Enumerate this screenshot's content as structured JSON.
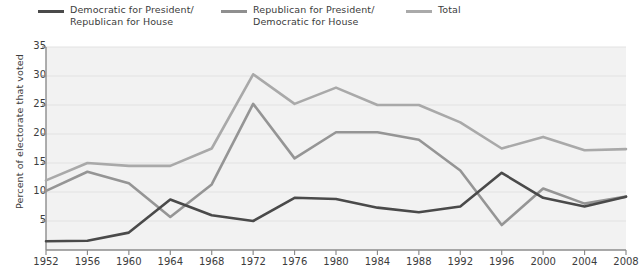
{
  "chart_data": {
    "type": "line",
    "title": "",
    "xlabel": "",
    "ylabel": "Percent of electorate that voted",
    "categories": [
      1952,
      1956,
      1960,
      1964,
      1968,
      1972,
      1976,
      1980,
      1984,
      1988,
      1992,
      1996,
      2000,
      2004,
      2008
    ],
    "x_tick_labels": [
      "1952",
      "1956",
      "1960",
      "1964",
      "1968",
      "1972",
      "1976",
      "1980",
      "1984",
      "1988",
      "1992",
      "1996",
      "2000",
      "2004",
      "2008"
    ],
    "y_tick_labels": [
      "5",
      "10",
      "15",
      "20",
      "25",
      "30",
      "35"
    ],
    "y_ticks": [
      5,
      10,
      15,
      20,
      25,
      30,
      35
    ],
    "ylim": [
      0,
      35
    ],
    "xlim": [
      1952,
      2008
    ],
    "grid": "horizontal",
    "legend_position": "top",
    "plot_background": "#f2f2f2",
    "grid_color": "#e2e2e2",
    "axis_color": "#8c8c8c",
    "series": [
      {
        "name": "Democratic for President/\nRepublican for House",
        "short_name": "Democratic for President / Republican for House",
        "color": "#4a4a4a",
        "values": [
          1.5,
          1.6,
          3.0,
          8.7,
          6.0,
          5.0,
          9.0,
          8.8,
          7.3,
          6.5,
          7.5,
          13.3,
          9.0,
          7.5,
          9.2
        ]
      },
      {
        "name": "Republican for President/\nDemocratic for House",
        "short_name": "Republican for President / Democratic for House",
        "color": "#959595",
        "values": [
          10.2,
          13.5,
          11.5,
          5.7,
          11.3,
          25.2,
          15.8,
          20.3,
          20.3,
          19.0,
          13.7,
          4.3,
          10.6,
          8.0,
          9.2
        ]
      },
      {
        "name": "Total",
        "short_name": "Total",
        "color": "#a9a9a9",
        "values": [
          12.0,
          15.0,
          14.5,
          14.5,
          17.5,
          30.3,
          25.2,
          28.0,
          25.0,
          25.0,
          22.0,
          17.5,
          19.5,
          17.2,
          17.4
        ]
      }
    ]
  },
  "legend": {
    "entries": [
      {
        "label": "Democratic for President/\nRepublican for House",
        "color": "#4a4a4a"
      },
      {
        "label": "Republican for President/\nDemocratic for House",
        "color": "#8f8f8f"
      },
      {
        "label": "Total",
        "color": "#aaaaaa"
      }
    ]
  }
}
